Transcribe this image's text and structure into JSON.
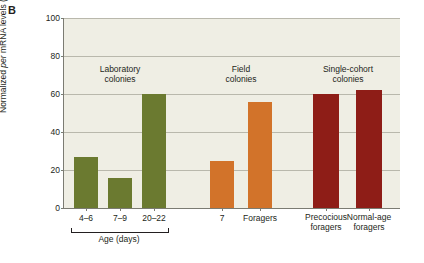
{
  "panel": {
    "label": "B"
  },
  "chart_data": {
    "type": "bar",
    "title": "",
    "xlabel": "Age (days)",
    "ylabel": "Normalized per mRNA levels (%)",
    "ylim": [
      0,
      100
    ],
    "yticks": [
      0,
      20,
      40,
      60,
      80,
      100
    ],
    "grid": true,
    "legend": "none",
    "categories": [
      "4–6",
      "7–9",
      "20–22",
      "7",
      "Foragers",
      "Precocious foragers",
      "Normal-age foragers"
    ],
    "values": [
      27,
      16,
      60,
      25,
      56,
      60,
      62
    ],
    "colors": [
      "#6b7a30",
      "#6b7a30",
      "#6b7a30",
      "#d2732a",
      "#d2732a",
      "#8e1d17",
      "#8e1d17"
    ],
    "groups": [
      {
        "title": "Laboratory colonies",
        "members": [
          0,
          1,
          2
        ]
      },
      {
        "title": "Field colonies",
        "members": [
          3,
          4
        ]
      },
      {
        "title": "Single-cohort colonies",
        "members": [
          5,
          6
        ]
      }
    ],
    "annotations": [
      "Age (days)"
    ]
  },
  "axis": {
    "y_tick_0": "0",
    "y_tick_1": "20",
    "y_tick_2": "40",
    "y_tick_3": "60",
    "y_tick_4": "80",
    "y_tick_5": "100",
    "y_title_part1": "Normalized ",
    "y_title_part2": "per",
    "y_title_part3": " mRNA levels (%)"
  },
  "xlabels": {
    "b0": "4–6",
    "b1": "7–9",
    "b2": "20–22",
    "b3": "7",
    "b4": "Foragers",
    "b5_line1": "Precocious",
    "b5_line2": "foragers",
    "b6_line1": "Normal-age",
    "b6_line2": "foragers",
    "age_caption": "Age (days)"
  },
  "group_titles": {
    "lab_line1": "Laboratory",
    "lab_line2": "colonies",
    "field_line1": "Field",
    "field_line2": "colonies",
    "sc_line1": "Single-cohort",
    "sc_line2": "colonies"
  }
}
